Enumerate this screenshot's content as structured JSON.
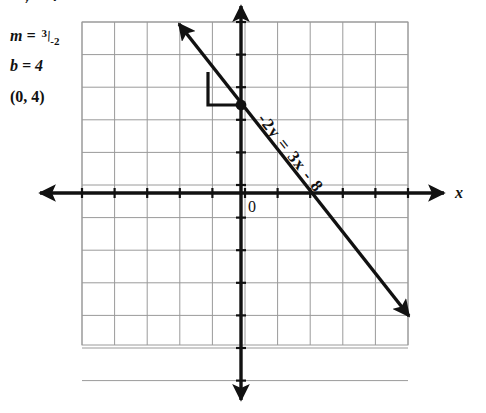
{
  "annotations": {
    "cut_top_text": "y = 4",
    "slope_label": "m",
    "slope_equals": "=",
    "slope_numerator": "3",
    "slope_bar": "/",
    "slope_denominator": "-2",
    "intercept_text": "b = 4",
    "point_text": "(0, 4)"
  },
  "graph": {
    "x_axis_label": "x",
    "y_axis_label": "",
    "origin_label": "0",
    "line_equation_label": "-2y = 3x - 8",
    "grid": {
      "columns": 10,
      "rows": 11,
      "cell_size": 32.6,
      "left": 82,
      "top": 22,
      "right": 408,
      "bottom": 345
    },
    "axes": {
      "x_axis_y": 193,
      "y_axis_x": 241,
      "x_axis_start": 40,
      "x_axis_end": 444,
      "y_axis_start": 6,
      "y_axis_end": 400
    },
    "plotted_point": {
      "label": "(0, 4)",
      "px": 241,
      "py": 105
    },
    "slope_triangle": {
      "corner_x": 208,
      "top_y": 72,
      "bottom_y": 105,
      "right_x": 241
    },
    "line_endpoints": {
      "x1": 179,
      "y1": 24,
      "x2": 409,
      "y2": 316
    },
    "colors": {
      "ink": "#111111",
      "grid": "#9a9a9a",
      "background": "#ffffff"
    }
  },
  "chart_data": {
    "type": "line",
    "title": "",
    "xlabel": "x",
    "ylabel": "y",
    "annotations": [
      "m = 3/-2",
      "b = 4",
      "(0, 4)",
      "-2y = 3x - 8"
    ],
    "equation": "-2y = 3x - 8",
    "slope": -1.5,
    "y_intercept": 4,
    "grid": true,
    "legend": "none",
    "xlim": [
      -5,
      5
    ],
    "ylim": [
      -5,
      6
    ],
    "series": [
      {
        "name": "-2y = 3x - 8",
        "x": [
          -3,
          -2,
          -1,
          0,
          1,
          2,
          3,
          4,
          5
        ],
        "values": [
          8.5,
          7,
          5.5,
          4,
          2.5,
          1,
          -0.5,
          -2,
          -3.5
        ]
      }
    ],
    "points": [
      {
        "label": "(0, 4)",
        "x": 0,
        "y": 4
      }
    ]
  }
}
